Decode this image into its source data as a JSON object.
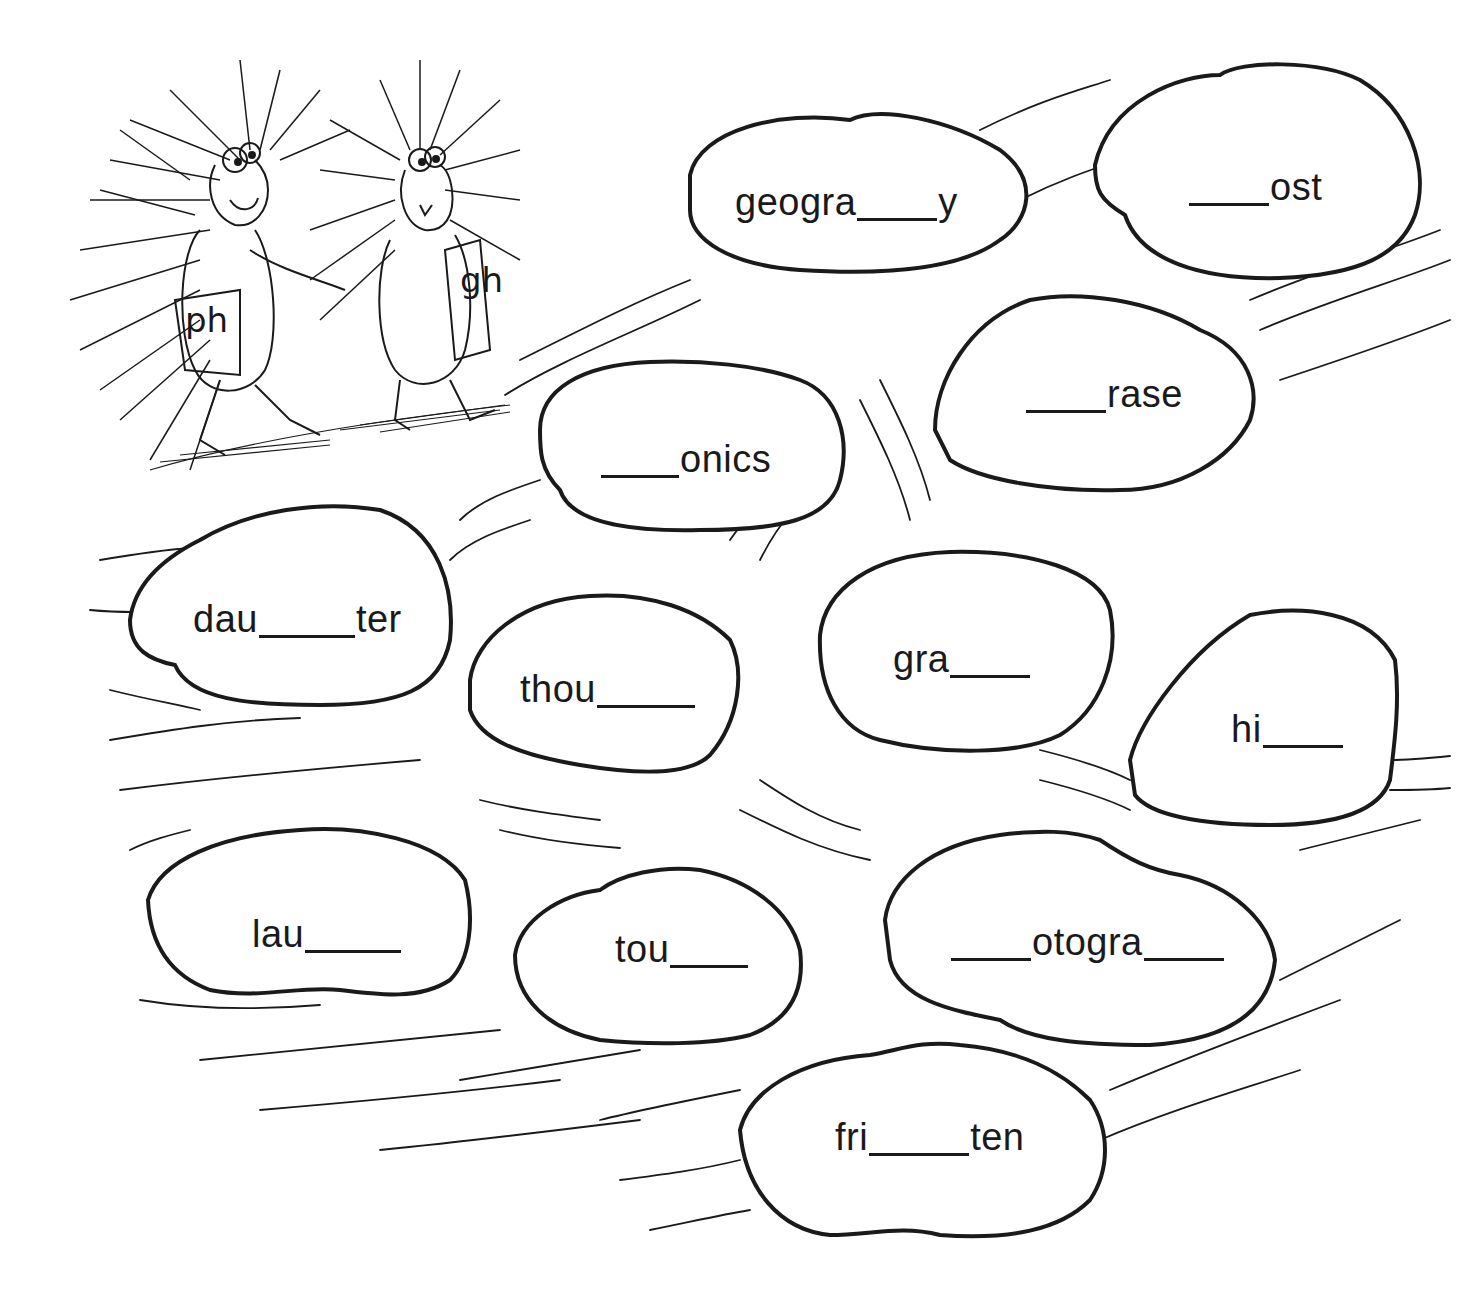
{
  "worksheet": {
    "characters": [
      {
        "name": "porcupine-ph",
        "shirt_label": "ph"
      },
      {
        "name": "porcupine-gh",
        "shirt_label": "gh"
      }
    ],
    "stones": [
      {
        "id": "geography",
        "parts": [
          "geogra",
          "_",
          "y"
        ],
        "blank_widths": [
          80
        ]
      },
      {
        "id": "ghost",
        "parts": [
          "_",
          "ost"
        ],
        "blank_widths": [
          80
        ]
      },
      {
        "id": "phrase",
        "parts": [
          "_",
          "rase"
        ],
        "blank_widths": [
          80
        ]
      },
      {
        "id": "phonics",
        "parts": [
          "_",
          "onics"
        ],
        "blank_widths": [
          80
        ]
      },
      {
        "id": "daughter",
        "parts": [
          "dau",
          "_",
          "ter"
        ],
        "blank_widths": [
          96
        ]
      },
      {
        "id": "thought",
        "parts": [
          "thou",
          "_"
        ],
        "blank_widths": [
          98
        ]
      },
      {
        "id": "graph",
        "parts": [
          "gra",
          "_"
        ],
        "blank_widths": [
          80
        ]
      },
      {
        "id": "high",
        "parts": [
          "hi",
          "_"
        ],
        "blank_widths": [
          80
        ]
      },
      {
        "id": "laugh",
        "parts": [
          "lau",
          "_"
        ],
        "blank_widths": [
          96
        ]
      },
      {
        "id": "tough",
        "parts": [
          "tou",
          "_"
        ],
        "blank_widths": [
          78
        ]
      },
      {
        "id": "photograph",
        "parts": [
          "_",
          "otogra",
          "_"
        ],
        "blank_widths": [
          80,
          80
        ]
      },
      {
        "id": "frighten",
        "parts": [
          "fri",
          "_",
          "ten"
        ],
        "blank_widths": [
          100
        ]
      }
    ],
    "labels": {
      "geography": {
        "pre": "geogra",
        "post": "y"
      },
      "ghost": {
        "pre": "",
        "post": "ost"
      },
      "phrase": {
        "pre": "",
        "post": "rase"
      },
      "phonics": {
        "pre": "",
        "post": "onics"
      },
      "daughter": {
        "pre": "dau",
        "post": "ter"
      },
      "thought": {
        "pre": "thou",
        "post": ""
      },
      "graph": {
        "pre": "gra",
        "post": ""
      },
      "high": {
        "pre": "hi",
        "post": ""
      },
      "laugh": {
        "pre": "lau",
        "post": ""
      },
      "tough": {
        "pre": "tou",
        "post": ""
      },
      "photograph": {
        "pre": "",
        "mid": "otogra",
        "post": ""
      },
      "frighten": {
        "pre": "fri",
        "post": "ten"
      }
    }
  },
  "colors": {
    "ink": "#1a1a1a",
    "paper": "#ffffff"
  }
}
